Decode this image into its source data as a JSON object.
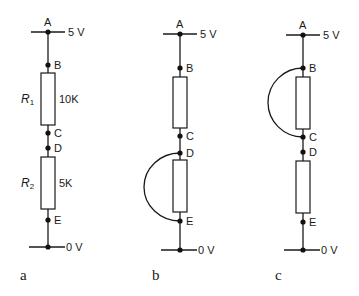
{
  "diagram": {
    "colors": {
      "line": "#1a1a1a",
      "background": "#ffffff"
    },
    "circuits": [
      {
        "id": "a",
        "caption": "a",
        "x": 48,
        "supply_label": "5 V",
        "ground_label": "0 V",
        "nodes": {
          "A": {
            "label": "A",
            "y": 32
          },
          "B": {
            "label": "B",
            "y": 65
          },
          "C": {
            "label": "C",
            "y": 133
          },
          "D": {
            "label": "D",
            "y": 148
          },
          "E": {
            "label": "E",
            "y": 220
          },
          "G": {
            "y": 247
          }
        },
        "resistors": [
          {
            "name": "R",
            "subscript": "1",
            "value": "10K",
            "top": 73,
            "bottom": 125
          },
          {
            "name": "R",
            "subscript": "2",
            "value": "5K",
            "top": 157,
            "bottom": 209
          }
        ],
        "short_circuit": null
      },
      {
        "id": "b",
        "caption": "b",
        "x": 180,
        "supply_label": "5 V",
        "ground_label": "0 V",
        "nodes": {
          "A": {
            "label": "A",
            "y": 34
          },
          "B": {
            "label": "B",
            "y": 68
          },
          "C": {
            "label": "C",
            "y": 136
          },
          "D": {
            "label": "D",
            "y": 153
          },
          "E": {
            "label": "E",
            "y": 221
          },
          "G": {
            "y": 250
          }
        },
        "resistors": [
          {
            "name": "",
            "subscript": "",
            "value": "",
            "top": 77,
            "bottom": 128
          },
          {
            "name": "",
            "subscript": "",
            "value": "",
            "top": 160,
            "bottom": 212
          }
        ],
        "short_circuit": {
          "from": "D",
          "to": "E",
          "leftmost_x": 144
        }
      },
      {
        "id": "c",
        "caption": "c",
        "x": 303,
        "supply_label": "5 V",
        "ground_label": "0 V",
        "nodes": {
          "A": {
            "label": "A",
            "y": 35
          },
          "B": {
            "label": "B",
            "y": 68
          },
          "C": {
            "label": "C",
            "y": 137
          },
          "D": {
            "label": "D",
            "y": 152
          },
          "E": {
            "label": "E",
            "y": 222
          },
          "G": {
            "y": 250
          }
        },
        "resistors": [
          {
            "name": "",
            "subscript": "",
            "value": "",
            "top": 77,
            "bottom": 129
          },
          {
            "name": "",
            "subscript": "",
            "value": "",
            "top": 161,
            "bottom": 213
          }
        ],
        "short_circuit": {
          "from": "B",
          "to": "C",
          "leftmost_x": 268
        }
      }
    ]
  }
}
